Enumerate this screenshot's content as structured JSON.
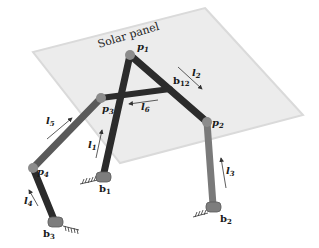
{
  "diagram": {
    "title": "Solar panel",
    "panel": {
      "label": "Solar panel",
      "fill": "#ececec",
      "edge": "#dadada",
      "corners": [
        [
          205,
          8
        ],
        [
          303,
          115
        ],
        [
          120,
          163
        ],
        [
          33,
          52
        ]
      ]
    },
    "colors": {
      "dark_link": "#2b2b2b",
      "mid_link": "#5a5a5a",
      "light_link": "#7a7a7a",
      "joint": "#8c8c8c",
      "base": "#7d7d7d",
      "arrow": "#333333"
    },
    "points": {
      "p1": {
        "label": "p",
        "sub": "1",
        "x": 130,
        "y": 55
      },
      "p2": {
        "label": "p",
        "sub": "2",
        "x": 207,
        "y": 122
      },
      "p3": {
        "label": "p",
        "sub": "3",
        "x": 101,
        "y": 98
      },
      "p4": {
        "label": "p",
        "sub": "4",
        "x": 33,
        "y": 168
      },
      "b1": {
        "label": "b",
        "sub": "1",
        "x": 103,
        "y": 180
      },
      "b2": {
        "label": "b",
        "sub": "2",
        "x": 213,
        "y": 208
      },
      "b3": {
        "label": "b",
        "sub": "3",
        "x": 55,
        "y": 224
      },
      "b12": {
        "label": "b",
        "sub": "12",
        "x": 170,
        "y": 89
      }
    },
    "links": [
      {
        "name": "l1",
        "label": "l",
        "sub": "1",
        "from": "b1",
        "to": "p1"
      },
      {
        "name": "l2",
        "label": "l",
        "sub": "2",
        "from": "p1",
        "to": "p2"
      },
      {
        "name": "l3",
        "label": "l",
        "sub": "3",
        "from": "b2",
        "to": "p2"
      },
      {
        "name": "l4",
        "label": "l",
        "sub": "4",
        "from": "b3",
        "to": "p4"
      },
      {
        "name": "l5",
        "label": "l",
        "sub": "5",
        "from": "p4",
        "to": "p3"
      },
      {
        "name": "l6",
        "label": "l",
        "sub": "6",
        "from": "b12",
        "to": "p3"
      }
    ],
    "labels": {
      "p1": "p",
      "p1_sub": "1",
      "p2": "p",
      "p2_sub": "2",
      "p3": "p",
      "p3_sub": "3",
      "p4": "p",
      "p4_sub": "4",
      "b1": "b",
      "b1_sub": "1",
      "b2": "b",
      "b2_sub": "2",
      "b3": "b",
      "b3_sub": "3",
      "b12": "b",
      "b12_sub": "12",
      "l1": "l",
      "l1_sub": "1",
      "l2": "l",
      "l2_sub": "2",
      "l3": "l",
      "l3_sub": "3",
      "l4": "l",
      "l4_sub": "4",
      "l5": "l",
      "l5_sub": "5",
      "l6": "l",
      "l6_sub": "6"
    }
  }
}
